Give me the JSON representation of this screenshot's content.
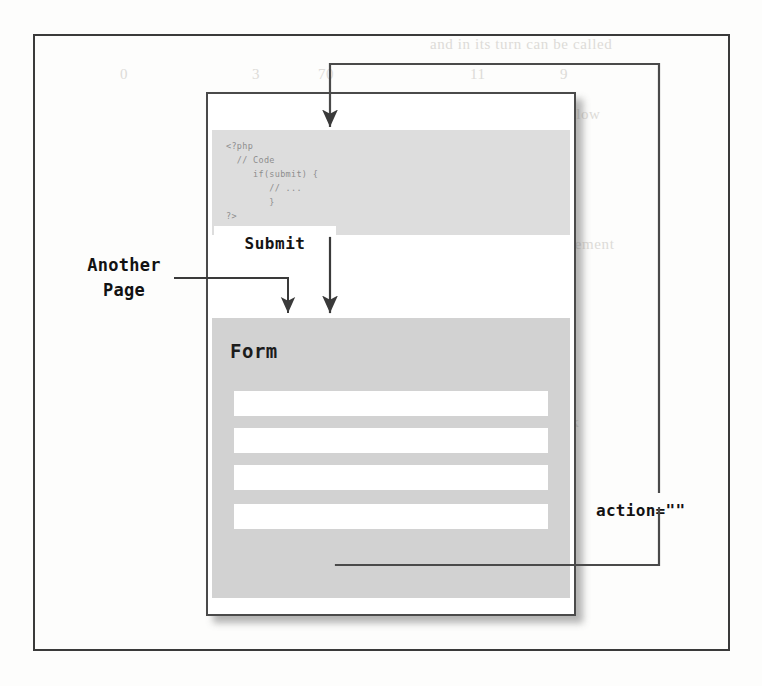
{
  "figure": {
    "kind": "diagram"
  },
  "page_card": {
    "code_block": {
      "language": "php",
      "lines": [
        "<?php",
        "  // Code",
        "     if(submit) {",
        "        // ...",
        "        }",
        "?>"
      ],
      "text": "<?php\n  // Code\n     if(submit) {\n        // ...\n        }\n?>"
    },
    "form": {
      "title": "Form",
      "fields": [
        {
          "name": "field-1",
          "value": ""
        },
        {
          "name": "field-2",
          "value": ""
        },
        {
          "name": "field-3",
          "value": ""
        },
        {
          "name": "field-4",
          "value": ""
        }
      ],
      "submit_label": "Submit"
    }
  },
  "annotations": {
    "another_page": "Another\nPage",
    "another_page_line1": "Another",
    "another_page_line2": "Page",
    "action_attribute": "action=\"\""
  },
  "flows": [
    {
      "id": "action-loopback",
      "from": "Submit",
      "to": "code-block",
      "label": "action=\"\""
    },
    {
      "id": "code-to-form",
      "from": "code-block",
      "to": "form",
      "label": ""
    },
    {
      "id": "another-page-to-form",
      "from": "Another Page",
      "to": "form",
      "label": ""
    }
  ],
  "colors": {
    "frame_stroke": "#3a3a3a",
    "page_stroke": "#4a4a4a",
    "code_block_bg": "#dddddd",
    "code_text": "#8d8d8d",
    "form_bg": "#d2d2d2",
    "input_bg": "#ffffff",
    "connector": "#4a4a4a",
    "text": "#121212",
    "paper": "#fdfdfc"
  },
  "background_ghost_text": [
    {
      "t": "and in its turn can be called",
      "x": 430,
      "y": 36
    },
    {
      "t": "we use the statement below",
      "x": 420,
      "y": 106
    },
    {
      "t": "in the length  function",
      "x": 420,
      "y": 138
    },
    {
      "t": "the value of the form element",
      "x": 420,
      "y": 236
    },
    {
      "t": "form can still be in the",
      "x": 420,
      "y": 262
    },
    {
      "t": "that can be used to check",
      "x": 414,
      "y": 414
    },
    {
      "t": "if this is the same page",
      "x": 414,
      "y": 440
    },
    {
      "t": "we will see the output",
      "x": 414,
      "y": 466
    },
    {
      "t": "of the form submission",
      "x": 414,
      "y": 548
    },
    {
      "t": "then",
      "x": 414,
      "y": 600
    },
    {
      "t": "0",
      "x": 120,
      "y": 66
    },
    {
      "t": "3",
      "x": 252,
      "y": 66
    },
    {
      "t": "70",
      "x": 318,
      "y": 66
    },
    {
      "t": "11",
      "x": 470,
      "y": 66
    },
    {
      "t": "9",
      "x": 560,
      "y": 66
    }
  ]
}
